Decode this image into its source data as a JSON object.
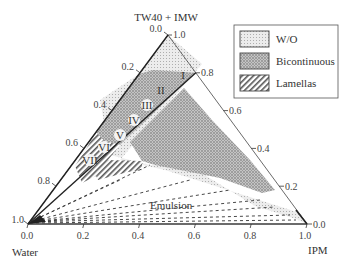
{
  "diagram": {
    "type": "ternary-phase-diagram",
    "vertices": {
      "top": "TW40 + IMW",
      "bottom_left": "Water",
      "bottom_right": "IPM"
    },
    "axes": {
      "left_ticks": [
        "0.0",
        "0.2",
        "0.4",
        "0.6",
        "0.8",
        "1.0"
      ],
      "right_ticks": [
        "1.0",
        "0.8",
        "0.6",
        "0.4",
        "0.2",
        "0.0"
      ],
      "bottom_ticks": [
        "0.0",
        "0.2",
        "0.4",
        "0.6",
        "0.8",
        "1.0"
      ]
    },
    "regions": {
      "numerals": [
        "I",
        "II",
        "III",
        "IV",
        "V",
        "VI",
        "VII"
      ],
      "emulsion": "Emulsion"
    },
    "legend": {
      "items": [
        {
          "label": "W/O",
          "pattern": "fine-dots"
        },
        {
          "label": "Bicontinuous",
          "pattern": "coarse-dots"
        },
        {
          "label": "Lamellas",
          "pattern": "diagonal-hatch"
        }
      ]
    },
    "colors": {
      "line": "#222222",
      "wo_fill": "#e6e6e6",
      "bicontinuous_fill": "#b8b8b8",
      "lamellas_hatch": "#555555"
    }
  }
}
